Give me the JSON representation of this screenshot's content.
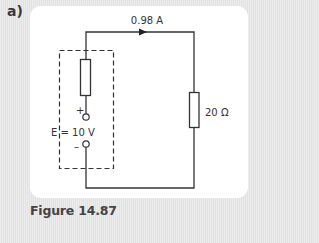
{
  "part_label": "a)",
  "caption": "Figure 14.87",
  "circuit": {
    "current_label": "0.98 A",
    "load_resistor_label": "20 Ω",
    "emf_label": "E = 10 V",
    "plus_label": "+",
    "minus_label": "–",
    "colors": {
      "wire": "#333333",
      "panel": "#ffffff",
      "background": "#e8e8e8"
    }
  }
}
